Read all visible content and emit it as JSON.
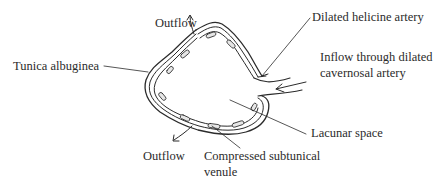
{
  "diagram": {
    "type": "anatomical-illustration",
    "colors": {
      "ink": "#2b2b2b",
      "background": "#ffffff",
      "fill": "#e6e6e6"
    }
  },
  "labels": {
    "outflow_top": "Outflow",
    "dilated_helicine_artery": "Dilated helicine artery",
    "tunica_albuginea": "Tunica albuginea",
    "inflow_line1": "Inflow through dilated",
    "inflow_line2": "cavernosal artery",
    "lacunar_space": "Lacunar space",
    "outflow_bottom": "Outflow",
    "compressed_line1": "Compressed subtunical",
    "compressed_line2": "venule"
  }
}
